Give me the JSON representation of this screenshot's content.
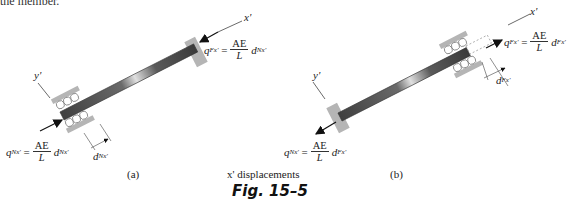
{
  "top_fragment": "the member.",
  "panel_a": {
    "label": "(a)",
    "axis_x": "x'",
    "axis_y": "y'",
    "force_far": {
      "symbol": "q",
      "sub": "Fx'",
      "numerator": "AE",
      "denominator": "L",
      "d_symbol": "d",
      "d_sub": "Nx'"
    },
    "force_near": {
      "symbol": "q",
      "sub": "Nx'",
      "numerator": "AE",
      "denominator": "L",
      "d_symbol": "d",
      "d_sub": "Nx'"
    },
    "displacement": {
      "symbol": "d",
      "sub": "Nx'"
    }
  },
  "panel_b": {
    "label": "(b)",
    "axis_x": "x'",
    "axis_y": "y'",
    "force_far": {
      "symbol": "q",
      "sub": "Fx'",
      "numerator": "AE",
      "denominator": "L",
      "d_symbol": "d",
      "d_sub": "Fx'"
    },
    "force_near": {
      "symbol": "q",
      "sub": "Nx'",
      "numerator": "AE",
      "denominator": "L",
      "d_symbol": "d",
      "d_sub": "Fx'"
    },
    "displacement": {
      "symbol": "d",
      "sub": "Fx'"
    }
  },
  "caption": {
    "subtitle": "x' displacements",
    "figure": "Fig. 15–5"
  },
  "colors": {
    "support": "#b5b5b5",
    "bar_dark": "#4a4a4a",
    "bar_light": "#d8d8d8",
    "ink": "#222222"
  }
}
